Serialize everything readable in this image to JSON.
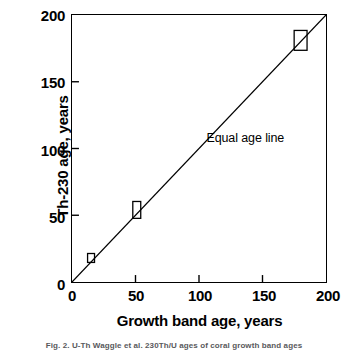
{
  "chart_data": {
    "type": "scatter",
    "title": "",
    "xlabel": "Growth band age, years",
    "ylabel": "Th-230 age, years",
    "xlim": [
      0,
      200
    ],
    "ylim": [
      0,
      200
    ],
    "xticks": [
      0,
      50,
      100,
      150,
      200
    ],
    "yticks": [
      0,
      50,
      100,
      150,
      200
    ],
    "xtick_labels": [
      "0",
      "50",
      "100",
      "150",
      "200"
    ],
    "ytick_labels": [
      "0",
      "50",
      "100",
      "150",
      "200"
    ],
    "grid": false,
    "legend": false,
    "tick_direction": "in",
    "frame": "full-box",
    "marker_style": "open-rectangle",
    "marker_color": "#000000",
    "marker_fill": "none",
    "points": [
      {
        "x": 15,
        "y": 18,
        "box_width": 7,
        "box_height": 9
      },
      {
        "x": 51,
        "y": 54,
        "box_width": 8,
        "box_height": 17
      },
      {
        "x": 180,
        "y": 181,
        "box_width": 13,
        "box_height": 20
      }
    ],
    "reference_line": {
      "label": "Equal age line",
      "from": [
        0,
        0
      ],
      "to": [
        200,
        200
      ],
      "slope": 1,
      "intercept": 0,
      "color": "#000000"
    },
    "annotations": [
      {
        "text": "Equal age line",
        "x": 105,
        "y": 108
      }
    ]
  },
  "caption": {
    "text": "Fig. 2.  U-Th Waggle et al. 230Th/U ages of coral growth band ages",
    "visible": "clipped"
  },
  "colors": {
    "background": "#ffffff",
    "axis": "#000000",
    "text": "#000000",
    "data": "#000000"
  }
}
